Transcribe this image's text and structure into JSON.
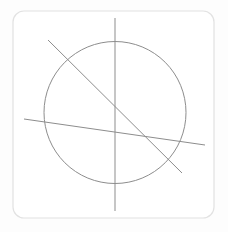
{
  "canvas": {
    "width": 228,
    "height": 232,
    "background_color": "#fdfdfd"
  },
  "card": {
    "name": "figure-card",
    "x": 13,
    "y": 11,
    "width": 201,
    "height": 207,
    "corner_radius": 11,
    "fill_color": "#ffffff",
    "border_color": "#e2e2e2",
    "border_width": 1.2
  },
  "figure": {
    "stroke_color": "#8d8d8d",
    "stroke_width": 1,
    "circle": {
      "label": "circle",
      "center_x": 115,
      "center_y": 112.5,
      "radius": 71,
      "fill": "none"
    },
    "lines": [
      {
        "label": "vertical-axis-line",
        "x1": 115,
        "y1": 18,
        "x2": 115,
        "y2": 211
      },
      {
        "label": "descending-diagonal-line",
        "x1": 48,
        "y1": 40,
        "x2": 182,
        "y2": 173
      },
      {
        "label": "near-horizontal-line",
        "x1": 24,
        "y1": 119,
        "x2": 205,
        "y2": 145
      }
    ]
  }
}
